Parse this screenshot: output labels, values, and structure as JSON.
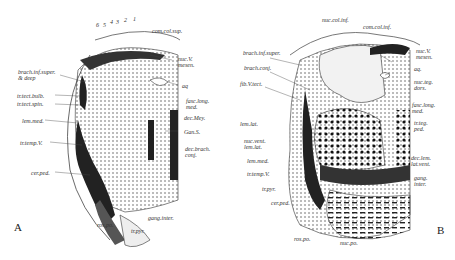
{
  "figure": {
    "panels": [
      {
        "letter": "A",
        "layer_numbers": [
          "6",
          "5",
          "4",
          "3",
          "2",
          "1"
        ],
        "labels": {
          "com_col_sup": "com.col.sup.",
          "nuc_v_mesen": "nuc.V.\nmesen.",
          "aq": "aq",
          "brach_inf": "brach.inf.super.\n& deep",
          "tr_tect_bulb": "tr.tect.bulb.",
          "tr_tect_spin": "tr.tect.spin.",
          "fasc_long_med": "fasc.long.\nmed.",
          "dec_mey": "dec.Mey.",
          "gan_s": "Gan.S.",
          "lem_med": "lem.med.",
          "dec_brach_conj": "dec.brach.\nconj.",
          "tr_temp_v": "tr.temp.V.",
          "cer_ped": "cer.ped.",
          "gang_inter": "gang.inter.",
          "ros_po": "ros.po.",
          "tr_pyr": "tr.pyr."
        }
      },
      {
        "letter": "B",
        "labels": {
          "nuc_col_inf": "nuc.col.inf.",
          "com_col_inf": "com.col.inf.",
          "brach_inf_super": "brach.inf.super.",
          "brach_conj": "brach.conj.",
          "fib_v_tect": "fib.V.tect.",
          "nuc_v_mesen": "nuc.V.\nmesen.",
          "aq": "aq.",
          "nuc_teg_dors": "nuc.teg.\ndors.",
          "fasc_long_med": "fasc.long.\nmed.",
          "tr_teg_ped": "tr.teg.\nped.",
          "lem_lat": "lem.lat.",
          "nuc_vent_lem_lat": "nuc.vent.\nlem.lat.",
          "lem_med": "lem.med.",
          "dec_lem_lat_vent": "dec.lem.\nlat.vent.",
          "tr_temp_v": "tr.temp.V.",
          "gang_inter": "gang.\ninter.",
          "tr_pyr": "tr.pyr.",
          "cer_ped": "cer.ped.",
          "ros_po": "ros.po.",
          "nuc_po": "nuc.po."
        }
      }
    ]
  }
}
